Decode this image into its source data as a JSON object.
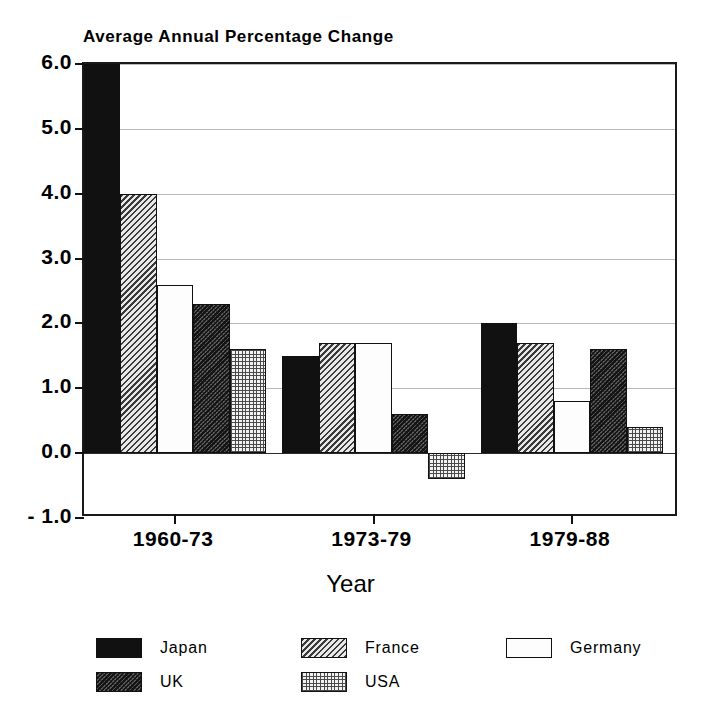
{
  "chart_data": {
    "type": "bar",
    "title": "Average Annual Percentage Change",
    "xlabel": "Year",
    "ylabel": "",
    "categories": [
      "1960-73",
      "1973-79",
      "1979-88"
    ],
    "ylim": [
      -1.0,
      6.0
    ],
    "ytick_labels": [
      "6.0",
      "5.0",
      "4.0",
      "3.0",
      "2.0",
      "1.0",
      "0.0",
      "- 1.0"
    ],
    "ytick_values": [
      6.0,
      5.0,
      4.0,
      3.0,
      2.0,
      1.0,
      0.0,
      -1.0
    ],
    "grid": true,
    "legend_position": "bottom",
    "series": [
      {
        "name": "Japan",
        "pattern": "solid-black",
        "values": [
          6.0,
          1.5,
          2.0
        ]
      },
      {
        "name": "France",
        "pattern": "diagonal-light",
        "values": [
          4.0,
          1.7,
          1.7
        ]
      },
      {
        "name": "Germany",
        "pattern": "white",
        "values": [
          2.6,
          1.7,
          0.8
        ]
      },
      {
        "name": "UK",
        "pattern": "diagonal-dark",
        "values": [
          2.3,
          0.6,
          1.6
        ]
      },
      {
        "name": "USA",
        "pattern": "fine-grid",
        "values": [
          1.6,
          -0.4,
          0.4
        ]
      }
    ]
  },
  "legend": {
    "entries": [
      {
        "label": "Japan",
        "swatch": "legend-swatch-japan"
      },
      {
        "label": "France",
        "swatch": "legend-swatch-france"
      },
      {
        "label": "Germany",
        "swatch": "legend-swatch-germany"
      },
      {
        "label": "UK",
        "swatch": "legend-swatch-uk"
      },
      {
        "label": "USA",
        "swatch": "legend-swatch-usa"
      }
    ]
  },
  "colors": {
    "ink": "#111111",
    "gridline": "#b9b9b9",
    "background": "#ffffff"
  }
}
